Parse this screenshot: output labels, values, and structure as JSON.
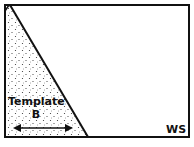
{
  "diagram": {
    "template_label_line1": "Template",
    "template_label_line2": "B",
    "workspace_label": "WS",
    "colors": {
      "stroke": "#111111",
      "background": "#ffffff",
      "stipple": "#333333"
    }
  }
}
